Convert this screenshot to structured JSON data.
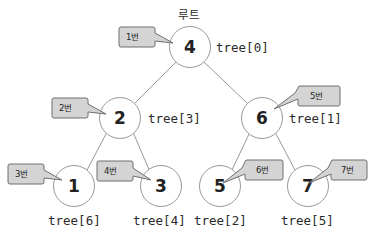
{
  "diagram": {
    "title_caption": "루트",
    "node_fill": "#ffffff",
    "node_stroke": "#9a9a9a",
    "callout_fill": "#d4d4d4",
    "callout_stroke": "#6f6f6f",
    "edge_color": "#8c8c8c",
    "text_color": "#2b2b2b"
  },
  "nodes": [
    {
      "id": "root",
      "value": "4",
      "array_label": "tree[0]",
      "callout": "1번",
      "caption": "루트"
    },
    {
      "id": "left",
      "value": "2",
      "array_label": "tree[3]",
      "callout": "2번"
    },
    {
      "id": "right",
      "value": "6",
      "array_label": "tree[1]",
      "callout": "5번"
    },
    {
      "id": "leaf-1",
      "value": "1",
      "array_label": "tree[6]",
      "callout": "3번"
    },
    {
      "id": "leaf-3",
      "value": "3",
      "array_label": "tree[4]",
      "callout": "4번"
    },
    {
      "id": "leaf-5",
      "value": "5",
      "array_label": "tree[2]",
      "callout": "6번"
    },
    {
      "id": "leaf-7",
      "value": "7",
      "array_label": "tree[5]",
      "callout": "7번"
    }
  ]
}
